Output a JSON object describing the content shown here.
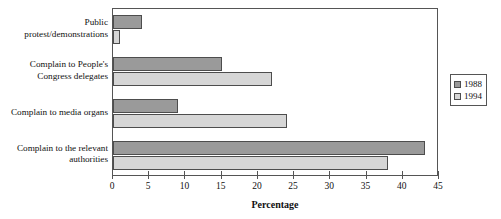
{
  "chart_data": {
    "type": "bar",
    "orientation": "horizontal",
    "title": "",
    "xlabel": "Percentage",
    "ylabel": "",
    "xlim": [
      0,
      45
    ],
    "xticks": [
      0,
      5,
      10,
      15,
      20,
      25,
      30,
      35,
      40,
      45
    ],
    "grid": false,
    "legend_position": "right",
    "categories": [
      "Public protest/demonstrations",
      "Complain to People's Congress delegates",
      "Complain to media organs",
      "Complain to the relevant authorities"
    ],
    "category_lines": [
      [
        "Public",
        "protest/demonstrations"
      ],
      [
        "Complain to People's",
        "Congress delegates"
      ],
      [
        "Complain to media organs"
      ],
      [
        "Complain to the relevant",
        "authorities"
      ]
    ],
    "series": [
      {
        "name": "1988",
        "color": "#9a9a9a",
        "values": [
          4,
          15,
          9,
          43
        ]
      },
      {
        "name": "1994",
        "color": "#d6d6d6",
        "values": [
          1,
          22,
          24,
          38
        ]
      }
    ]
  },
  "legend": {
    "items": [
      {
        "label": "1988",
        "color": "#9a9a9a"
      },
      {
        "label": "1994",
        "color": "#d6d6d6"
      }
    ]
  },
  "axis": {
    "x_title": "Percentage",
    "tick_labels": [
      "0",
      "5",
      "10",
      "15",
      "20",
      "25",
      "30",
      "35",
      "40",
      "45"
    ]
  }
}
